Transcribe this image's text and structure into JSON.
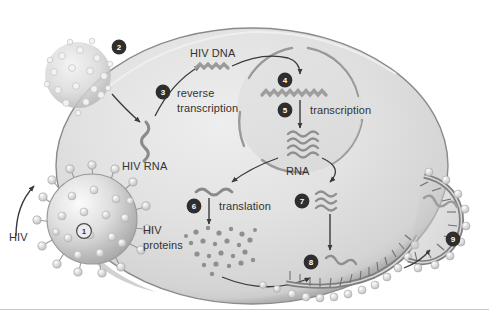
{
  "figure": {
    "type": "biological-process-diagram",
    "palette": {
      "background": "#ffffff",
      "cell_cytoplasm_light": "#e4e4e4",
      "cell_cytoplasm_mid": "#d2d2d2",
      "cell_membrane_dark": "#8d8d8d",
      "nucleus_fill": "#dcdcdc",
      "nucleus_outline": "#9a9a9a",
      "nucleic_acid": "#8a8a8a",
      "text": "#333333",
      "arrow": "#3a3a3a",
      "marker_dark_fill": "#2e2e2e",
      "marker_light_fill": "#ededed",
      "virion_body": "#cfcfcf",
      "virion_spike": "#efefef",
      "divider": "#c9c9c9"
    }
  },
  "labels": {
    "hiv_virion": "HIV",
    "hiv_rna": "HIV RNA",
    "hiv_dna": "HIV DNA",
    "reverse_transcription_line1": "reverse",
    "reverse_transcription_line2": "transcription",
    "transcription": "transcription",
    "rna": "RNA",
    "translation": "translation",
    "hiv_proteins_line1": "HIV",
    "hiv_proteins_line2": "proteins"
  },
  "steps": [
    {
      "number": "1",
      "style": "light",
      "meaning": "virus binds and fuses with host cell membrane"
    },
    {
      "number": "2",
      "style": "dark",
      "meaning": "viral core enters cytoplasm and uncoats"
    },
    {
      "number": "3",
      "style": "dark",
      "meaning": "reverse transcription of HIV RNA into HIV DNA"
    },
    {
      "number": "4",
      "style": "dark",
      "meaning": "viral DNA integrates into host chromosome in nucleus"
    },
    {
      "number": "5",
      "style": "dark",
      "meaning": "transcription of integrated DNA into RNA"
    },
    {
      "number": "6",
      "style": "dark",
      "meaning": "translation of RNA into HIV proteins"
    },
    {
      "number": "7",
      "style": "dark",
      "meaning": "genomic RNA transported to membrane"
    },
    {
      "number": "8",
      "style": "dark",
      "meaning": "assembly of new virus particle at membrane"
    },
    {
      "number": "9",
      "style": "dark",
      "meaning": "budding and release of mature virion"
    }
  ]
}
